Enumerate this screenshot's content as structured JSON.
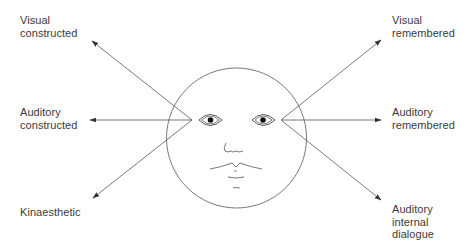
{
  "diagram": {
    "type": "eye-accessing-cues",
    "labels": {
      "visual_constructed": "Visual\nconstructed",
      "auditory_constructed": "Auditory\nconstructed",
      "kinaesthetic": "Kinaesthetic",
      "visual_remembered": "Visual\nremembered",
      "auditory_remembered": "Auditory\nremembered",
      "auditory_internal_dialogue": "Auditory\ninternal\ndialogue"
    },
    "arrows": [
      {
        "from": "left-eye",
        "to": "visual_constructed",
        "direction": "up-left"
      },
      {
        "from": "left-eye",
        "to": "auditory_constructed",
        "direction": "left"
      },
      {
        "from": "left-eye",
        "to": "kinaesthetic",
        "direction": "down-left"
      },
      {
        "from": "right-eye",
        "to": "visual_remembered",
        "direction": "up-right"
      },
      {
        "from": "right-eye",
        "to": "auditory_remembered",
        "direction": "right"
      },
      {
        "from": "right-eye",
        "to": "auditory_internal_dialogue",
        "direction": "down-right"
      }
    ],
    "colors": {
      "line": "#555555",
      "text": "#3a3a3a",
      "background": "#ffffff"
    }
  }
}
